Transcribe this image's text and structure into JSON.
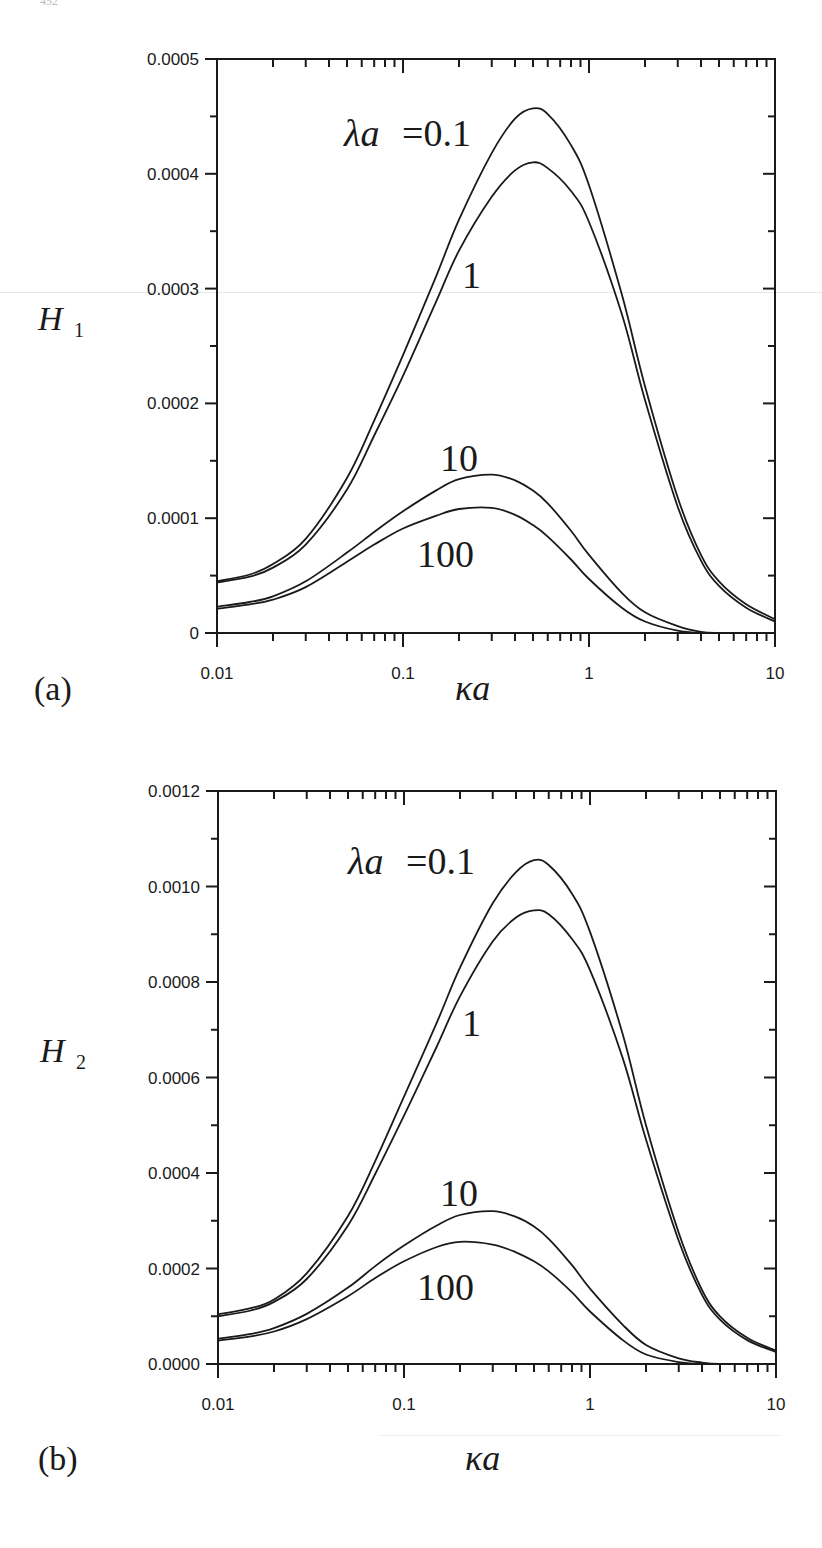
{
  "page": {
    "page_number_fragment": "452"
  },
  "chart_data": [
    {
      "id": "a",
      "type": "line",
      "panel_label": "(a)",
      "title": "",
      "xlabel": "κa",
      "ylabel": "H",
      "ylabel_sub": "1",
      "xscale": "log",
      "xlim": [
        0.01,
        10
      ],
      "ylim": [
        0,
        0.0005
      ],
      "grid": false,
      "legend": "inline curve labels",
      "x_ticks": [
        0.01,
        0.1,
        1,
        10
      ],
      "x_tick_labels": [
        "0.01",
        "0.1",
        "1",
        "10"
      ],
      "y_ticks": [
        0,
        0.0001,
        0.0002,
        0.0003,
        0.0004,
        0.0005
      ],
      "y_tick_labels": [
        "0",
        "0.0001",
        "0.0002",
        "0.0003",
        "0.0004",
        "0.0005"
      ],
      "y_minor_step": 5e-05,
      "x": [
        0.01,
        0.015,
        0.02,
        0.03,
        0.05,
        0.07,
        0.1,
        0.15,
        0.2,
        0.3,
        0.4,
        0.5,
        0.6,
        0.8,
        1,
        1.5,
        2,
        3,
        4,
        5,
        7,
        10
      ],
      "series": [
        {
          "name": "λa = 0.1",
          "label": "λa = 0.1",
          "values": [
            4.5e-05,
            5.1e-05,
            6e-05,
            8.2e-05,
            0.000135,
            0.000185,
            0.000242,
            0.00031,
            0.00036,
            0.000418,
            0.000448,
            0.000457,
            0.000452,
            0.000425,
            0.00039,
            0.000295,
            0.000215,
            0.000118,
            6.8e-05,
            4.5e-05,
            2.5e-05,
            1.2e-05
          ]
        },
        {
          "name": "λa = 1",
          "label": "1",
          "values": [
            4.4e-05,
            4.9e-05,
            5.7e-05,
            7.7e-05,
            0.000125,
            0.000172,
            0.000224,
            0.000288,
            0.000333,
            0.00038,
            0.000403,
            0.00041,
            0.000405,
            0.000385,
            0.000358,
            0.000278,
            0.000203,
            0.00011,
            6.3e-05,
            4.1e-05,
            2.2e-05,
            1e-05
          ]
        },
        {
          "name": "λa = 10",
          "label": "10",
          "values": [
            2.3e-05,
            2.7e-05,
            3.2e-05,
            4.5e-05,
            7e-05,
            8.8e-05,
            0.000106,
            0.000124,
            0.000134,
            0.000138,
            0.000133,
            0.000124,
            0.000113,
            8.9e-05,
            6.8e-05,
            3.5e-05,
            1.8e-05,
            6e-06,
            1e-06,
            0.0,
            0.0,
            0.0
          ]
        },
        {
          "name": "λa = 100",
          "label": "100",
          "values": [
            2.1e-05,
            2.5e-05,
            2.9e-05,
            4e-05,
            6.2e-05,
            7.7e-05,
            9.1e-05,
            0.000102,
            0.000108,
            0.000109,
            0.000103,
            9.4e-05,
            8.4e-05,
            6.4e-05,
            4.7e-05,
            2.2e-05,
            1e-05,
            2e-06,
            0.0,
            0.0,
            0.0,
            0.0
          ]
        }
      ]
    },
    {
      "id": "b",
      "type": "line",
      "panel_label": "(b)",
      "title": "",
      "xlabel": "κa",
      "ylabel": "H",
      "ylabel_sub": "2",
      "xscale": "log",
      "xlim": [
        0.01,
        10
      ],
      "ylim": [
        0,
        0.0012
      ],
      "grid": false,
      "legend": "inline curve labels",
      "x_ticks": [
        0.01,
        0.1,
        1,
        10
      ],
      "x_tick_labels": [
        "0.01",
        "0.1",
        "1",
        "10"
      ],
      "y_ticks": [
        0,
        0.0002,
        0.0004,
        0.0006,
        0.0008,
        0.001,
        0.0012
      ],
      "y_tick_labels": [
        "0.0000",
        "0.0002",
        "0.0004",
        "0.0006",
        "0.0008",
        "0.0010",
        "0.0012"
      ],
      "y_minor_step": 0.0001,
      "x": [
        0.01,
        0.015,
        0.02,
        0.03,
        0.05,
        0.07,
        0.1,
        0.15,
        0.2,
        0.3,
        0.4,
        0.5,
        0.6,
        0.8,
        1,
        1.5,
        2,
        3,
        4,
        5,
        7,
        10
      ],
      "series": [
        {
          "name": "λa = 0.1",
          "label": "λa = 0.1",
          "values": [
            0.000104,
            0.000117,
            0.000135,
            0.00019,
            0.00031,
            0.000425,
            0.00056,
            0.000715,
            0.00083,
            0.000965,
            0.00103,
            0.001055,
            0.001045,
            0.000985,
            0.000905,
            0.00069,
            0.0005,
            0.000275,
            0.000155,
            0.0001,
            5.5e-05,
            2.8e-05
          ]
        },
        {
          "name": "λa = 1",
          "label": "1",
          "values": [
            0.0001,
            0.000112,
            0.00013,
            0.000178,
            0.00029,
            0.000398,
            0.00052,
            0.000665,
            0.00077,
            0.000885,
            0.000935,
            0.00095,
            0.000942,
            0.00089,
            0.000825,
            0.00064,
            0.00047,
            0.000258,
            0.000145,
            9.3e-05,
            5e-05,
            2.5e-05
          ]
        },
        {
          "name": "λa = 10",
          "label": "10",
          "values": [
            5.3e-05,
            6.3e-05,
            7.5e-05,
            0.000105,
            0.00016,
            0.000205,
            0.000248,
            0.00029,
            0.000312,
            0.00032,
            0.000308,
            0.000288,
            0.000262,
            0.000207,
            0.000158,
            8.2e-05,
            4e-05,
            1.2e-05,
            3e-06,
            0.0,
            0.0,
            0.0
          ]
        },
        {
          "name": "λa = 100",
          "label": "100",
          "values": [
            4.9e-05,
            5.8e-05,
            6.8e-05,
            9.4e-05,
            0.000142,
            0.00018,
            0.000215,
            0.000245,
            0.000256,
            0.00025,
            0.000234,
            0.000215,
            0.000194,
            0.00015,
            0.00011,
            5e-05,
            2e-05,
            4e-06,
            0.0,
            0.0,
            0.0,
            0.0
          ]
        }
      ]
    }
  ]
}
